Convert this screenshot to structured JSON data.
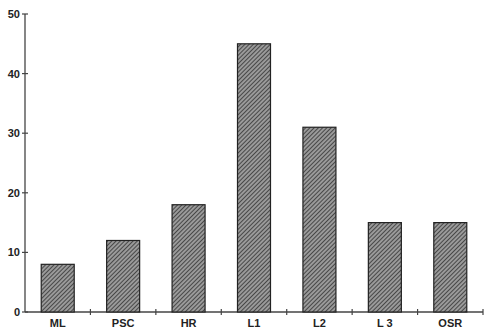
{
  "chart_data": {
    "type": "bar",
    "title": "",
    "xlabel": "",
    "ylabel": "",
    "categories": [
      "ML",
      "PSC",
      "HR",
      "L1",
      "L2",
      "L 3",
      "OSR"
    ],
    "values": [
      8,
      12,
      18,
      45,
      31,
      15,
      15
    ],
    "ylim": [
      0,
      50
    ],
    "yticks": [
      0,
      10,
      20,
      30,
      40,
      50
    ],
    "grid": false,
    "legend": null,
    "bar_fill": "diagonal-hatch",
    "bar_color": "#555555"
  }
}
